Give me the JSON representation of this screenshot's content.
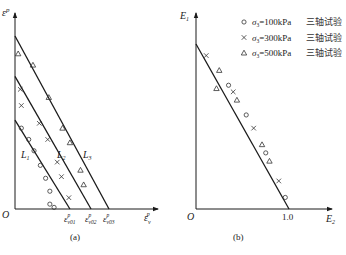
{
  "chart_data": [
    {
      "type": "scatter",
      "panel_label": "(a)",
      "ylabel": "ε^p",
      "xlabel": "ε_v^p",
      "origin_label": "O",
      "x_tick_labels": [
        "ε_v01^p",
        "ε_v02^p",
        "ε_v03^p"
      ],
      "x_ticks": [
        0.52,
        0.72,
        0.89
      ],
      "xlim": [
        0,
        1.2
      ],
      "ylim": [
        0,
        1.2
      ],
      "grid": false,
      "lines": [
        {
          "name": "L1",
          "label_main": "L",
          "label_sub": "1",
          "x": [
            0,
            0.52
          ],
          "y": [
            0.55,
            0
          ]
        },
        {
          "name": "L2",
          "label_main": "L",
          "label_sub": "2",
          "x": [
            0,
            0.72
          ],
          "y": [
            0.82,
            0
          ]
        },
        {
          "name": "L3",
          "label_main": "L",
          "label_sub": "3",
          "x": [
            0,
            0.89
          ],
          "y": [
            1.07,
            0
          ]
        }
      ],
      "series": [
        {
          "name": "σ3=100kPa",
          "marker": "circle",
          "x": [
            0.06,
            0.13,
            0.18,
            0.24,
            0.29,
            0.33,
            0.33,
            0.37
          ],
          "y": [
            0.5,
            0.43,
            0.36,
            0.27,
            0.19,
            0.11,
            0.03,
            0.01
          ]
        },
        {
          "name": "σ3=300kPa",
          "marker": "cross",
          "x": [
            0.05,
            0.06,
            0.23,
            0.31,
            0.4,
            0.44,
            0.51
          ],
          "y": [
            0.74,
            0.64,
            0.53,
            0.43,
            0.29,
            0.2,
            0.07
          ]
        },
        {
          "name": "σ3=500kPa",
          "marker": "triangle",
          "x": [
            0.03,
            0.17,
            0.32,
            0.45,
            0.52,
            0.62,
            0.65
          ],
          "y": [
            0.96,
            0.89,
            0.69,
            0.5,
            0.41,
            0.24,
            0.15
          ]
        }
      ]
    },
    {
      "type": "scatter",
      "panel_label": "(b)",
      "ylabel": "E_1",
      "xlabel": "E_2",
      "origin_label": "O",
      "x_tick_labels": [
        "1.0"
      ],
      "x_ticks": [
        1.0
      ],
      "xlim": [
        0,
        1.32
      ],
      "ylim": [
        0,
        1.2
      ],
      "grid": false,
      "lines": [
        {
          "name": "fit",
          "x": [
            0,
            1.0
          ],
          "y": [
            1.0,
            0
          ]
        }
      ],
      "legend": {
        "placement": "top-right",
        "entries": [
          {
            "marker": "circle",
            "sigma": "σ",
            "sub": "3",
            "text": "=100kPa",
            "cjk": "三轴试验"
          },
          {
            "marker": "cross",
            "sigma": "σ",
            "sub": "3",
            "text": "=300kPa",
            "cjk": "三轴试验"
          },
          {
            "marker": "triangle",
            "sigma": "σ",
            "sub": "3",
            "text": "=500kPa",
            "cjk": "三轴试验"
          }
        ]
      },
      "series": [
        {
          "name": "σ3=100kPa 三轴试验",
          "marker": "circle",
          "x": [
            0.35,
            0.54,
            0.75,
            0.96
          ],
          "y": [
            0.75,
            0.57,
            0.34,
            0.07
          ]
        },
        {
          "name": "σ3=300kPa 三轴试验",
          "marker": "cross",
          "x": [
            0.11,
            0.4,
            0.62,
            0.89
          ],
          "y": [
            0.93,
            0.71,
            0.49,
            0.17
          ]
        },
        {
          "name": "σ3=500kPa 三轴试验",
          "marker": "triangle",
          "x": [
            0.25,
            0.22,
            0.44,
            0.71,
            0.79
          ],
          "y": [
            0.84,
            0.73,
            0.66,
            0.39,
            0.29
          ]
        }
      ]
    }
  ]
}
